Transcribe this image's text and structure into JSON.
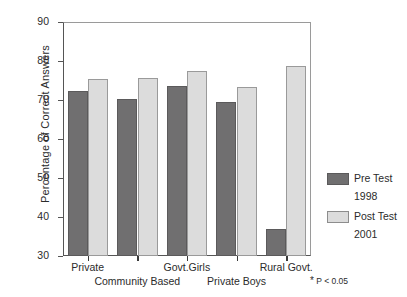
{
  "chart_data": {
    "type": "bar",
    "title": "",
    "xlabel": "",
    "ylabel": "Percentage of Correct Answers",
    "ylim": [
      30,
      90
    ],
    "yticks": [
      30,
      40,
      50,
      60,
      70,
      80,
      90
    ],
    "grid": false,
    "legend_position": "right",
    "categories": [
      "Private",
      "Community Based",
      "Govt.Girls",
      "Private Boys",
      "Rural Govt."
    ],
    "series": [
      {
        "name": "Pre Test 1998",
        "short_name": "Pre Test",
        "sub_name": "1998",
        "color": "#706F70",
        "values": [
          72.3,
          70.3,
          73.7,
          69.4,
          37.0
        ]
      },
      {
        "name": "Post Test 2001",
        "short_name": "Post Test",
        "sub_name": "2001",
        "color": "#DCDCDC",
        "values": [
          75.5,
          75.6,
          77.4,
          73.4,
          78.6
        ]
      }
    ],
    "annotations": [
      "* P < 0.05"
    ]
  },
  "axis": {
    "y_title": "Percentage of Correct Answers",
    "y_tick_labels": [
      "90",
      "80",
      "70",
      "60",
      "50",
      "40",
      "30"
    ],
    "x_tick_labels_row1": [
      "Private",
      "Govt.Girls",
      "Rural Govt."
    ],
    "x_tick_labels_row2": [
      "Community Based",
      "Private Boys"
    ]
  },
  "legend": {
    "entries": [
      {
        "label": "Pre Test",
        "sub": "1998",
        "color": "#706F70"
      },
      {
        "label": "Post Test",
        "sub": "2001",
        "color": "#DCDCDC"
      }
    ]
  },
  "footnote": {
    "star": "*",
    "text": "P < 0.05"
  }
}
